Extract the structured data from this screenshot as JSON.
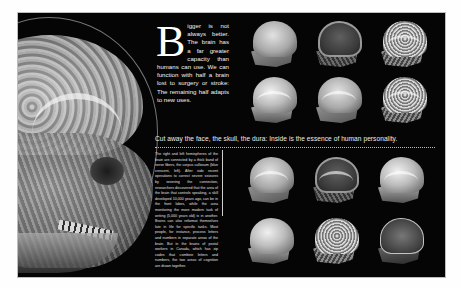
{
  "spread": {
    "background_color": "#050505",
    "page_color": "#fefefe"
  },
  "hero_image": {
    "subject": "Sagittal cutaway render of a human head showing brain, skull and face",
    "icon": "skull-brain-render"
  },
  "intro": {
    "drop_cap": "B",
    "text": "igger is not always better. The brain has a far greater capacity than humans can use. We can function with half a brain lost to surgery or stroke: The remaining half adapts to new uses."
  },
  "caption": {
    "text": "Cut away the face, the skull, the dura: Inside is the essence of human personality."
  },
  "body": {
    "text": "The right and left hemispheres of the brain are connected by a thick band of nerve fibers, the corpus callosum (blue crescent, left). After side recent operations to correct severe seizures by severing the connection, researchers discovered that the area of the brain that controls speaking, a skill developed 10,000 years ago, can be in the front lobes, while the area monitoring the more modern task of writing (5,000 years old) is in another. Brains can also reformat themselves late in life for specific tasks. Most people, for instance, process letters and numbers in separate areas of the brain. But in the brains of postal workers in Canada, which has zip codes that combine letters and numbers, the two areas of cognition are drawn together."
  },
  "top_grid": {
    "items": [
      {
        "label": "head-render-1",
        "tone": "a"
      },
      {
        "label": "head-render-2",
        "tone": "b"
      },
      {
        "label": "head-render-3",
        "tone": "c"
      },
      {
        "label": "head-render-4",
        "tone": "d"
      },
      {
        "label": "head-render-5",
        "tone": "a"
      },
      {
        "label": "head-render-6",
        "tone": "c"
      }
    ]
  },
  "bottom_grid": {
    "items": [
      {
        "label": "head-render-7",
        "tone": "a"
      },
      {
        "label": "head-render-8",
        "tone": "b"
      },
      {
        "label": "head-render-9",
        "tone": "d"
      },
      {
        "label": "head-render-10",
        "tone": "d"
      },
      {
        "label": "head-render-11",
        "tone": "c"
      },
      {
        "label": "head-render-12",
        "tone": "e"
      }
    ]
  }
}
